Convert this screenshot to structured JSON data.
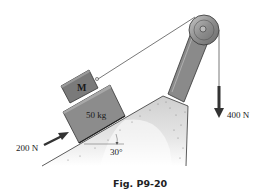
{
  "figure": {
    "caption": "Fig. P9-20",
    "incline_angle_label": "30°",
    "block_lower": {
      "label": "50 kg"
    },
    "block_upper": {
      "label": "M"
    },
    "force_push": {
      "label": "200 N",
      "direction": "up-the-incline"
    },
    "force_hanging": {
      "label": "400 N",
      "direction": "downward"
    },
    "elements": [
      "inclined-ground",
      "50kg-block",
      "M-block",
      "rope",
      "pulley",
      "pulley-support-arm",
      "hanging-force-arrow",
      "push-force-arrow",
      "angle-marker"
    ],
    "colors": {
      "block_fill": "#8c8c8c",
      "block_top_fill": "#7a7a7a",
      "ground_fill": "#d9d9d9",
      "arrow": "#333333",
      "pulley": "#9a9a9a",
      "arm": "#8a8a8a"
    }
  }
}
